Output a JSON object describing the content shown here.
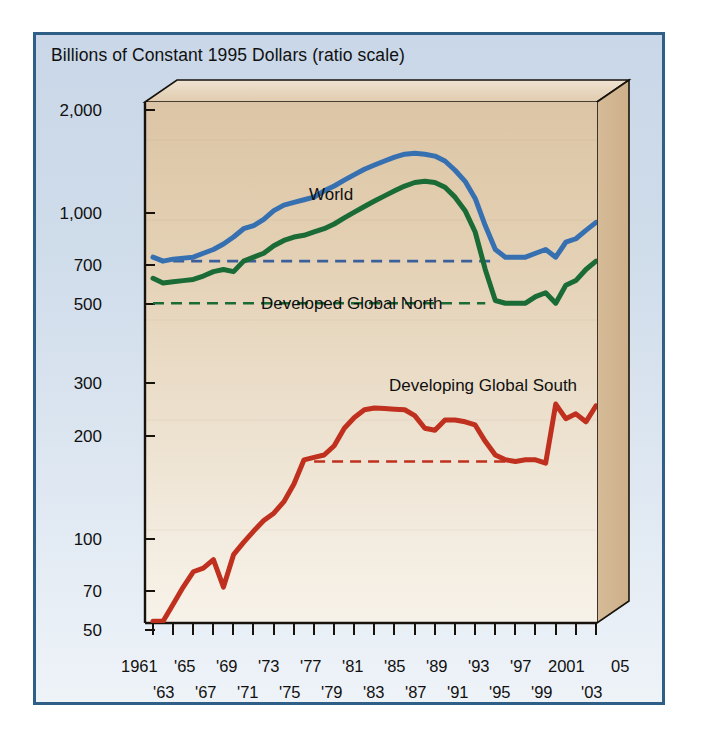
{
  "figure": {
    "title": "Billions of Constant 1995 Dollars (ratio scale)",
    "frame_border_color": "#2f5f86",
    "panel_background": "#cfdcea",
    "plot_background": "#e4d0b4"
  },
  "annotations": {
    "world": "World",
    "north": "Developed Global North",
    "south": "Developing Global South"
  },
  "axis": {
    "y_ticks": [
      "2,000",
      "1,000",
      "700",
      "500",
      "300",
      "200",
      "100",
      "70",
      "50"
    ],
    "x_top_row": [
      "1961",
      "'65",
      "'69",
      "'73",
      "'77",
      "'81",
      "'85",
      "'89",
      "'93",
      "'97",
      "2001",
      "05"
    ],
    "x_bottom_row": [
      "'63",
      "'67",
      "'71",
      "'75",
      "'79",
      "'83",
      "'87",
      "'91",
      "'95",
      "'99",
      "'03"
    ]
  },
  "chart_data": {
    "type": "line",
    "title": "Billions of Constant 1995 Dollars (ratio scale)",
    "xlabel": "",
    "ylabel": "Billions of Constant 1995 Dollars",
    "yscale": "log",
    "ylim": [
      45,
      2400
    ],
    "xlim": [
      1961,
      2005
    ],
    "grid": false,
    "legend": "inline-annotations",
    "y_tick_values": [
      2000,
      1000,
      700,
      500,
      300,
      200,
      100,
      70,
      50
    ],
    "y_tick_labels": [
      "2,000",
      "1,000",
      "700",
      "500",
      "300",
      "200",
      "100",
      "70",
      "50"
    ],
    "x_tick_values": [
      1961,
      1963,
      1965,
      1967,
      1969,
      1971,
      1973,
      1975,
      1977,
      1979,
      1981,
      1983,
      1985,
      1987,
      1989,
      1991,
      1993,
      1995,
      1997,
      1999,
      2001,
      2003,
      2005
    ],
    "x": [
      1961,
      1962,
      1963,
      1964,
      1965,
      1966,
      1967,
      1968,
      1969,
      1970,
      1971,
      1972,
      1973,
      1974,
      1975,
      1976,
      1977,
      1978,
      1979,
      1980,
      1981,
      1982,
      1983,
      1984,
      1985,
      1986,
      1987,
      1988,
      1989,
      1990,
      1991,
      1992,
      1993,
      1994,
      1995,
      1996,
      1997,
      1998,
      1999,
      2000,
      2001,
      2002,
      2003,
      2004,
      2005
    ],
    "series": [
      {
        "name": "World",
        "color": "#3670b0",
        "values": [
          720,
          700,
          710,
          715,
          720,
          740,
          760,
          790,
          830,
          880,
          900,
          940,
          1000,
          1040,
          1060,
          1080,
          1100,
          1150,
          1190,
          1240,
          1290,
          1340,
          1380,
          1420,
          1460,
          1490,
          1500,
          1490,
          1470,
          1420,
          1330,
          1230,
          1090,
          900,
          760,
          720,
          720,
          720,
          740,
          760,
          720,
          800,
          820,
          870,
          920
        ]
      },
      {
        "name": "Developed Global North",
        "color": "#1a6b36",
        "values": [
          620,
          600,
          605,
          610,
          615,
          630,
          650,
          660,
          650,
          700,
          720,
          740,
          780,
          810,
          830,
          840,
          860,
          880,
          910,
          950,
          990,
          1030,
          1070,
          1110,
          1150,
          1190,
          1220,
          1230,
          1220,
          1180,
          1100,
          1000,
          860,
          660,
          530,
          520,
          520,
          520,
          545,
          560,
          520,
          590,
          610,
          660,
          700
        ]
      },
      {
        "name": "Developing Global South",
        "color": "#c0301e",
        "values": [
          55,
          55,
          62,
          70,
          78,
          80,
          85,
          70,
          88,
          96,
          104,
          112,
          118,
          128,
          145,
          172,
          175,
          178,
          190,
          215,
          232,
          245,
          248,
          247,
          246,
          245,
          235,
          215,
          212,
          228,
          228,
          225,
          220,
          196,
          178,
          172,
          170,
          172,
          172,
          168,
          255,
          230,
          238,
          225,
          252
        ]
      }
    ],
    "reference_lines": [
      {
        "label": "World reference",
        "value": 700,
        "color": "#3b5f9a",
        "style": "dashed",
        "x_start": 1963,
        "x_end": 1995
      },
      {
        "label": "Developed Global North reference",
        "value": 520,
        "color": "#1a6b36",
        "style": "dashed",
        "x_start": 1961,
        "x_end": 1994
      },
      {
        "label": "Developing Global South reference",
        "value": 170,
        "color": "#c0301e",
        "style": "dashed",
        "x_start": 1977,
        "x_end": 1996
      }
    ]
  }
}
